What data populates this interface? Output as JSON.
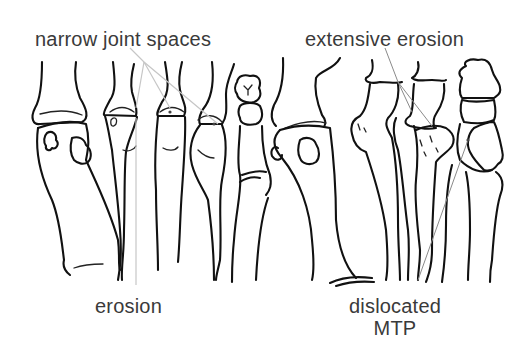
{
  "figure": {
    "colors": {
      "line": "#111111",
      "leader": "#8a8a8a",
      "text": "#3a3a3a",
      "background": "#ffffff"
    }
  },
  "labels": {
    "top_left": "narrow joint spaces",
    "top_right": "extensive erosion",
    "bottom_left": "erosion",
    "bottom_right_line1": "dislocated",
    "bottom_right_line2": "MTP"
  },
  "panels": [
    {
      "id": "left-foot",
      "annotations": [
        "narrow joint spaces",
        "erosion"
      ]
    },
    {
      "id": "right-foot",
      "annotations": [
        "extensive erosion",
        "dislocated MTP"
      ]
    }
  ]
}
